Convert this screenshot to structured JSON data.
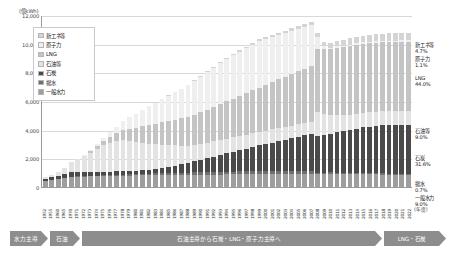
{
  "chart_data": {
    "type": "bar",
    "title": "",
    "subtitle": "",
    "unit_label": "(億kWh)",
    "xlabel": "(年度)",
    "ylabel": "",
    "ylim": [
      0,
      12000
    ],
    "yticks": [
      "0",
      "2,000",
      "4,000",
      "6,000",
      "8,000",
      "10,000",
      "12,000"
    ],
    "ytick_values": [
      0,
      2000,
      4000,
      6000,
      8000,
      10000,
      12000
    ],
    "grid": true,
    "stacked": true,
    "legend_position": "inside-top-left",
    "series": [
      {
        "name": "一般水力",
        "color": "#9e9e9e",
        "values": [
          420,
          480,
          560,
          620,
          700,
          720,
          730,
          745,
          760,
          770,
          780,
          790,
          795,
          800,
          805,
          810,
          815,
          820,
          825,
          830,
          835,
          840,
          845,
          850,
          855,
          860,
          865,
          870,
          875,
          880,
          885,
          890,
          895,
          900,
          905,
          910,
          915,
          920,
          925,
          930,
          935,
          940,
          880,
          900,
          910,
          905,
          900,
          895,
          890,
          885,
          880,
          875,
          870,
          865,
          860,
          855,
          850
        ]
      },
      {
        "name": "揚水",
        "color": "#6f6f6f",
        "values": [
          0,
          0,
          0,
          10,
          20,
          25,
          30,
          35,
          40,
          45,
          55,
          65,
          75,
          85,
          95,
          105,
          115,
          125,
          135,
          145,
          155,
          160,
          165,
          170,
          175,
          180,
          185,
          190,
          195,
          200,
          205,
          210,
          215,
          220,
          215,
          210,
          205,
          200,
          195,
          190,
          185,
          180,
          120,
          110,
          105,
          100,
          95,
          90,
          88,
          86,
          84,
          82,
          80,
          78,
          76,
          74,
          72
        ]
      },
      {
        "name": "石炭",
        "color": "#4a4a4a",
        "values": [
          160,
          190,
          230,
          270,
          300,
          290,
          280,
          270,
          260,
          250,
          245,
          240,
          235,
          230,
          240,
          260,
          290,
          330,
          380,
          440,
          510,
          590,
          680,
          780,
          880,
          980,
          1080,
          1180,
          1280,
          1380,
          1480,
          1580,
          1680,
          1780,
          1880,
          1980,
          2080,
          2180,
          2280,
          2380,
          2480,
          2580,
          2550,
          2600,
          2700,
          2800,
          2900,
          3000,
          3100,
          3200,
          3250,
          3300,
          3350,
          3380,
          3400,
          3420,
          3440
        ]
      },
      {
        "name": "石油等",
        "color": "#e3e3e3",
        "values": [
          120,
          180,
          280,
          420,
          700,
          900,
          1100,
          1350,
          1600,
          1850,
          2000,
          2100,
          2150,
          2100,
          2000,
          1900,
          1800,
          1700,
          1600,
          1500,
          1400,
          1300,
          1200,
          1150,
          1100,
          1080,
          1060,
          1040,
          1020,
          1000,
          980,
          960,
          950,
          940,
          930,
          920,
          910,
          900,
          890,
          880,
          870,
          860,
          1650,
          1500,
          1300,
          1200,
          1100,
          1050,
          1020,
          1000,
          990,
          985,
          982,
          980,
          978,
          976,
          975
        ]
      },
      {
        "name": "LNG",
        "color": "#c4c4c4",
        "values": [
          0,
          0,
          0,
          0,
          0,
          20,
          60,
          120,
          200,
          300,
          420,
          560,
          700,
          850,
          1000,
          1150,
          1300,
          1450,
          1600,
          1700,
          1800,
          1900,
          2000,
          2100,
          2200,
          2300,
          2400,
          2500,
          2600,
          2700,
          2800,
          2900,
          3000,
          3100,
          3200,
          3300,
          3400,
          3500,
          3600,
          3700,
          3800,
          3900,
          4400,
          4500,
          4600,
          4700,
          4750,
          4780,
          4800,
          4810,
          4820,
          4810,
          4805,
          4800,
          4795,
          4790,
          4785
        ]
      },
      {
        "name": "原子力",
        "color": "#efefef",
        "values": [
          0,
          0,
          0,
          0,
          10,
          20,
          40,
          70,
          120,
          200,
          320,
          460,
          620,
          800,
          980,
          1150,
          1300,
          1450,
          1600,
          1750,
          1900,
          2050,
          2200,
          2350,
          2500,
          2650,
          2750,
          2850,
          2950,
          3050,
          3100,
          3150,
          3200,
          3250,
          3200,
          3150,
          3100,
          3050,
          3000,
          2950,
          2900,
          2850,
          900,
          200,
          120,
          110,
          115,
          118,
          120,
          118,
          116,
          115,
          114,
          113,
          112,
          111,
          110
        ]
      },
      {
        "name": "新エネ等",
        "color": "#d4d4d4",
        "values": [
          0,
          0,
          0,
          0,
          0,
          0,
          0,
          0,
          0,
          0,
          0,
          0,
          0,
          0,
          5,
          8,
          12,
          16,
          20,
          25,
          30,
          35,
          40,
          45,
          50,
          55,
          60,
          70,
          80,
          90,
          100,
          110,
          120,
          130,
          140,
          150,
          160,
          170,
          180,
          190,
          200,
          210,
          260,
          300,
          350,
          400,
          430,
          450,
          465,
          475,
          485,
          495,
          500,
          505,
          508,
          510,
          512
        ]
      }
    ],
    "categories": [
      "1952",
      "1955",
      "1960",
      "1965",
      "1970",
      "1971",
      "1972",
      "1973",
      "1974",
      "1975",
      "1976",
      "1977",
      "1978",
      "1979",
      "1980",
      "1981",
      "1982",
      "1983",
      "1984",
      "1985",
      "1986",
      "1987",
      "1988",
      "1989",
      "1990",
      "1991",
      "1992",
      "1993",
      "1994",
      "1995",
      "1996",
      "1997",
      "1998",
      "1999",
      "2000",
      "2001",
      "2002",
      "2003",
      "2004",
      "2005",
      "2006",
      "2007",
      "2008",
      "2009",
      "2010",
      "2011",
      "2012",
      "2013",
      "2014",
      "2015",
      "2016",
      "2017",
      "2018",
      "2019",
      "2020",
      "2021",
      "2022"
    ]
  },
  "legend": {
    "items": [
      {
        "label": "新エネ等",
        "color": "#d4d4d4"
      },
      {
        "label": "原子力",
        "color": "#efefef"
      },
      {
        "label": "LNG",
        "color": "#c4c4c4"
      },
      {
        "label": "石油等",
        "color": "#e3e3e3"
      },
      {
        "label": "石炭",
        "color": "#4a4a4a"
      },
      {
        "label": "揚水",
        "color": "#6f6f6f"
      },
      {
        "label": "一般水力",
        "color": "#9e9e9e"
      }
    ]
  },
  "right_labels": [
    {
      "name": "新エネ等",
      "value": "4.7%",
      "top": 0
    },
    {
      "name": "原子力",
      "value": "1.1%",
      "top": 14
    },
    {
      "name": "LNG",
      "value": "44.0%",
      "top": 33
    },
    {
      "name": "石油等",
      "value": "9.0%",
      "top": 86
    },
    {
      "name": "石炭",
      "value": "31.6%",
      "top": 113
    },
    {
      "name": "揚水",
      "value": "0.7%",
      "top": 139
    },
    {
      "name": "一般水力",
      "value": "9.0%",
      "top": 153
    }
  ],
  "eras": [
    {
      "label": "水力主導",
      "width": 38
    },
    {
      "label": "石油",
      "width": 30
    },
    {
      "label": "石油主導から石炭・LNG・原子力主導へ",
      "width": 300
    },
    {
      "label": "LNG・石炭",
      "width": 62
    }
  ]
}
